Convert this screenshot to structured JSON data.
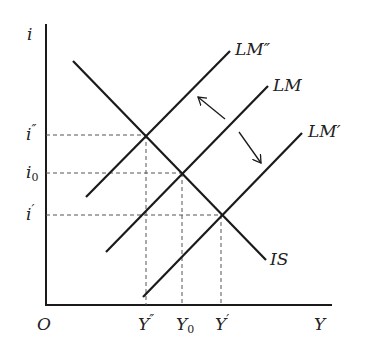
{
  "axes": {
    "y_label": "i",
    "x_label": "Y",
    "origin_label": "O"
  },
  "curves": [
    {
      "id": "IS",
      "label": "IS",
      "type": "downward-sloping"
    },
    {
      "id": "LM2",
      "label": "LM″",
      "type": "upward-sloping",
      "position": "left"
    },
    {
      "id": "LM0",
      "label": "LM",
      "type": "upward-sloping",
      "position": "middle"
    },
    {
      "id": "LM1",
      "label": "LM′",
      "type": "upward-sloping",
      "position": "right"
    }
  ],
  "equilibria": [
    {
      "id": "E2",
      "curves": [
        "IS",
        "LM2"
      ],
      "i_label": "i″",
      "y_label": "Y″"
    },
    {
      "id": "E0",
      "curves": [
        "IS",
        "LM0"
      ],
      "i_label": "i0",
      "y_label": "Y0"
    },
    {
      "id": "E1",
      "curves": [
        "IS",
        "LM1"
      ],
      "i_label": "i′",
      "y_label": "Y′"
    }
  ],
  "y_ticks": [
    {
      "base": "i",
      "mark": "″",
      "sub": ""
    },
    {
      "base": "i",
      "mark": "",
      "sub": "0"
    },
    {
      "base": "i",
      "mark": "′",
      "sub": ""
    }
  ],
  "x_ticks": [
    {
      "base": "Y",
      "mark": "″",
      "sub": ""
    },
    {
      "base": "Y",
      "mark": "",
      "sub": "0"
    },
    {
      "base": "Y",
      "mark": "′",
      "sub": ""
    }
  ],
  "shift_arrows": [
    {
      "from": "LM",
      "to": "LM″",
      "direction": "up-left"
    },
    {
      "from": "LM",
      "to": "LM′",
      "direction": "down-right"
    }
  ],
  "colors": {
    "line": "#1a1a1a",
    "guide": "#555555",
    "background": "#ffffff"
  }
}
